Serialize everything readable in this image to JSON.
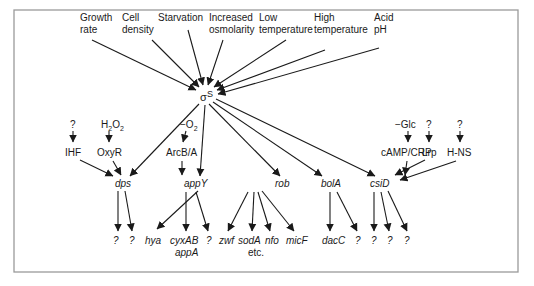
{
  "hub": {
    "label": "σ",
    "superscript": "S"
  },
  "signals": [
    {
      "id": "growth",
      "lines": [
        "Growth",
        "rate"
      ]
    },
    {
      "id": "density",
      "lines": [
        "Cell",
        "density"
      ]
    },
    {
      "id": "starvation",
      "lines": [
        "Starvation",
        ""
      ]
    },
    {
      "id": "osmolarity",
      "lines": [
        "Increased",
        "osmolarity"
      ]
    },
    {
      "id": "lowtemp",
      "lines": [
        "Low",
        "temperature"
      ]
    },
    {
      "id": "hightemp",
      "lines": [
        "High",
        "temperature"
      ]
    },
    {
      "id": "acid",
      "lines": [
        "Acid",
        "pH"
      ]
    }
  ],
  "regulators_inputs": {
    "ihf_input": "?",
    "oxyr_input": "H2O2",
    "arcba_input": "−O2",
    "crp_input": "−Glc",
    "lrp_input": "?",
    "hns_input": "?"
  },
  "regulators": {
    "ihf": "IHF",
    "oxyr": "OxyR",
    "arcba": "ArcB/A",
    "crp": "cAMP/CRP",
    "lrp": "Lrp",
    "hns": "H-NS"
  },
  "genes": {
    "dps": "dps",
    "appY": "appY",
    "rob": "rob",
    "bolA": "bolA",
    "csiD": "csiD"
  },
  "targets": {
    "dps": [
      "?",
      "?"
    ],
    "appY": [
      "hya",
      "cyxAB",
      "?"
    ],
    "appY_sub": "appA",
    "rob": [
      "zwf",
      "sodA",
      "nfo",
      "micF"
    ],
    "rob_sub": "etc.",
    "bolA": [
      "dacC",
      "?"
    ],
    "csiD": [
      "?",
      "?",
      "?"
    ]
  },
  "colors": {
    "ink": "#1a1a1a",
    "frame": "#9a9a9a",
    "background": "#ffffff"
  }
}
